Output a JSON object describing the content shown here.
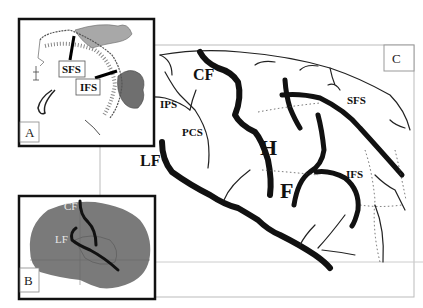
{
  "figure": {
    "panels": [
      {
        "id": "A",
        "tag": "A",
        "labels": {
          "sfs": "SFS",
          "ifs": "IFS"
        },
        "colors": {
          "region_light": "#a8a8a8",
          "region_dark": "#6f6f6f"
        }
      },
      {
        "id": "B",
        "tag": "B",
        "labels": {
          "cf": "CF",
          "lf": "LF"
        },
        "colors": {
          "brain_fill": "#7a7a7a",
          "label_text": "#e8e8e8"
        }
      },
      {
        "id": "C",
        "tag": "C",
        "labels": {
          "cf": "CF",
          "ips": "IPS",
          "pcs": "PCS",
          "lf": "LF",
          "h": "H",
          "f": "F",
          "sfs": "SFS",
          "ifs": "IFS"
        }
      }
    ],
    "colors": {
      "sulcus_stroke": "#111111",
      "frame": "#111111",
      "grid": "#bbbbbb"
    }
  }
}
